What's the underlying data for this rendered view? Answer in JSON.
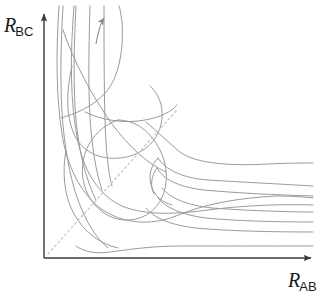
{
  "figure": {
    "kind": "potential-energy-surface-contour-plot",
    "background_color": "#ffffff"
  },
  "axes": {
    "x_axis": {
      "label_symbol": "R",
      "label_subscript": "AB",
      "color": "#3a3a3a",
      "arrow": "arrow-right"
    },
    "y_axis": {
      "label_symbol": "R",
      "label_subscript": "BC",
      "color": "#3a3a3a",
      "arrow": "arrow-up"
    }
  },
  "annotations": {
    "reaction_path_arrow": {
      "name": "reaction-path-arrow",
      "direction": "up-right",
      "color": "#8c8c8c"
    },
    "dashed_diagonal": {
      "name": "dashed-symmetry-line",
      "color": "#c8c8c8",
      "dash": "2 3"
    }
  },
  "chart_data": {
    "type": "line",
    "title": "",
    "xlabel": "R_AB",
    "ylabel": "R_BC",
    "grid": false,
    "legend": null,
    "xlim": [
      0,
      1
    ],
    "ylim": [
      0,
      1
    ],
    "contour_color": "#9a9a9a",
    "contour_count": 9,
    "series": [
      {
        "name": "entrance-channel-contour-1",
        "path": "M 63,6 C 61,40 60,78 62,112 C 64,146 70,178 78,200 C 86,222 96,238 108,248"
      },
      {
        "name": "entrance-channel-contour-2",
        "path": "M 76,6 C 74,44 73,86 76,120 C 79,152 86,180 96,200"
      },
      {
        "name": "entrance-channel-contour-3",
        "path": "M 90,6 C 89,42 88,84 90,118 C 92,148 96,172 102,190"
      },
      {
        "name": "entrance-channel-contour-4",
        "path": "M 104,6 C 104,44 104,86 105,120 C 106,150 108,172 112,186"
      },
      {
        "name": "crossing-contour-sweep",
        "path": "M 63,30 C 74,62 92,96 112,124 C 130,148 148,164 166,172"
      },
      {
        "name": "corner-outer-contour",
        "path": "M 59,6 C 56,52 56,96 62,134 C 67,166 80,192 100,208 C 122,224 150,226 176,216 C 204,204 238,198 276,196 C 292,196 305,197 313,198"
      },
      {
        "name": "corner-mid-contour",
        "path": "M 74,6 C 70,56 70,104 78,142 C 85,174 100,196 122,206 C 146,216 178,214 208,210 C 246,205 286,204 313,205"
      },
      {
        "name": "saddle-ridge-contour",
        "path": "M 85,112 C 101,120 124,124 145,120 C 161,117 171,112 177,105"
      },
      {
        "name": "inner-well-loop",
        "path": "M 118,120 C 100,126 86,142 83,162 C 80,182 88,202 104,213 C 120,224 142,222 155,208 C 168,194 170,170 160,150 C 151,132 136,120 118,120 Z"
      },
      {
        "name": "exit-channel-contour-1",
        "path": "M 313,186 C 280,184 240,182 208,180 C 182,178 166,170 158,158"
      },
      {
        "name": "exit-channel-contour-2",
        "path": "M 313,196 C 278,195 236,193 204,190 C 178,187 163,179 157,168"
      },
      {
        "name": "exit-channel-contour-3",
        "path": "M 313,212 C 280,212 240,210 212,208 C 186,205 170,198 162,188"
      },
      {
        "name": "exit-channel-contour-4",
        "path": "M 313,222 C 278,222 236,221 206,218 C 182,215 166,208 158,198"
      },
      {
        "name": "exit-channel-contour-5",
        "path": "M 313,232 C 272,232 228,231 196,228 C 170,225 154,218 146,208"
      },
      {
        "name": "floor-contour",
        "path": "M 313,246 C 270,246 218,246 180,246 C 150,246 126,250 110,252 C 96,254 84,252 76,246"
      }
    ]
  }
}
